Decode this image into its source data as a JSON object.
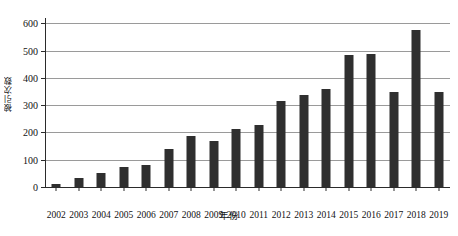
{
  "chart_data": {
    "type": "bar",
    "title": "",
    "xlabel": "年份",
    "ylabel": "被引次数",
    "categories": [
      "2002",
      "2003",
      "2004",
      "2005",
      "2006",
      "2007",
      "2008",
      "2009",
      "2010",
      "2011",
      "2012",
      "2013",
      "2014",
      "2015",
      "2016",
      "2017",
      "2018",
      "2019"
    ],
    "values": [
      12,
      33,
      52,
      73,
      80,
      140,
      186,
      168,
      212,
      229,
      315,
      337,
      361,
      484,
      487,
      350,
      577,
      350
    ],
    "series": [
      {
        "name": "被引次数",
        "values": [
          12,
          33,
          52,
          73,
          80,
          140,
          186,
          168,
          212,
          229,
          315,
          337,
          361,
          484,
          487,
          350,
          577,
          350
        ]
      }
    ],
    "ylim": [
      0,
      620
    ],
    "yticks": [
      0,
      100,
      200,
      300,
      400,
      500,
      600
    ],
    "ytick_labels": [
      "0",
      "100",
      "200",
      "300",
      "400",
      "500",
      "600"
    ],
    "grid": "horizontal",
    "legend": "none",
    "bar_color": "#2f2f2f",
    "gridline_color": "#9a9a9a",
    "axis_color": "#2b2b2b",
    "background": "#ffffff"
  }
}
